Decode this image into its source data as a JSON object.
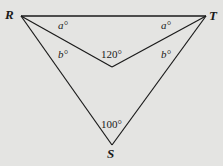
{
  "diagram": {
    "type": "geometry",
    "vertices": {
      "R": {
        "label": "R",
        "x": 21,
        "y": 16
      },
      "T": {
        "label": "T",
        "x": 206,
        "y": 16
      },
      "S": {
        "label": "S",
        "x": 112,
        "y": 145
      },
      "P": {
        "label": "",
        "x": 112,
        "y": 67
      }
    },
    "angles": {
      "a_left": "a°",
      "a_right": "a°",
      "b_left": "b°",
      "b_right": "b°",
      "inner": "120°",
      "bottom": "100°"
    },
    "colors": {
      "line": "#1a1a1a",
      "background": "#e4e4e2"
    }
  }
}
